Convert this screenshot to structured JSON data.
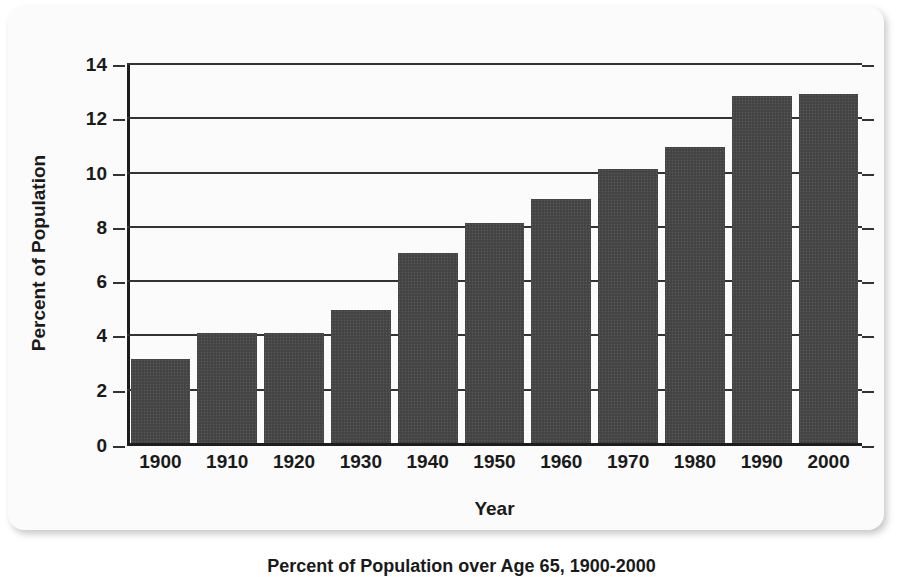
{
  "figure": {
    "caption": "Percent of Population over Age 65, 1900-2000"
  },
  "chart_data": {
    "type": "bar",
    "title": "",
    "xlabel": "Year",
    "ylabel": "Percent of Population",
    "categories": [
      "1900",
      "1910",
      "1920",
      "1930",
      "1940",
      "1950",
      "1960",
      "1970",
      "1980",
      "1990",
      "2000"
    ],
    "values": [
      3.1,
      4.05,
      4.05,
      4.9,
      7.0,
      8.1,
      9.0,
      10.1,
      10.9,
      12.8,
      12.85
    ],
    "ylim": [
      0,
      14
    ],
    "yticks": [
      "0",
      "2",
      "4",
      "6",
      "8",
      "10",
      "12",
      "14"
    ],
    "ytick_values": [
      0,
      2,
      4,
      6,
      8,
      10,
      12,
      14
    ],
    "grid": "horizontal",
    "legend": "none",
    "bar_color": "#474747",
    "axis_color": "#1d1d1d",
    "gridline_color": "#333333",
    "background_color": "#fbfbfb"
  }
}
